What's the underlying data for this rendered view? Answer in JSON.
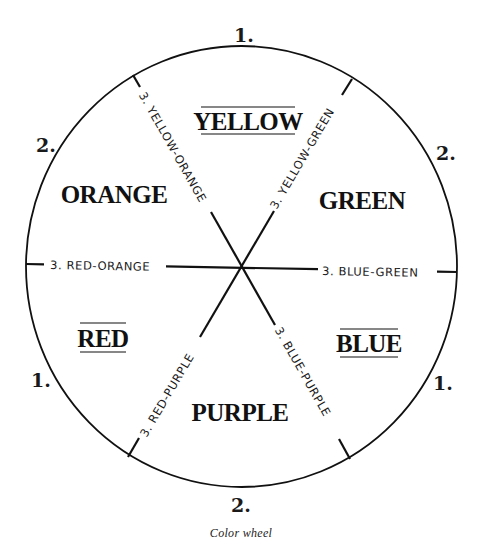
{
  "figure": {
    "caption": "Color wheel",
    "line_color": "#111111",
    "background": "#ffffff"
  },
  "rank_markers": {
    "top": "1.",
    "upper_left": "2.",
    "upper_right": "2.",
    "lower_left": "1.",
    "lower_right": "1.",
    "bottom": "2."
  },
  "segments": {
    "yellow": {
      "label": "YELLOW",
      "type": "primary",
      "underlined": true
    },
    "green": {
      "label": "GREEN",
      "type": "secondary",
      "underlined": false
    },
    "blue": {
      "label": "BLUE",
      "type": "primary",
      "underlined": true
    },
    "purple": {
      "label": "PURPLE",
      "type": "secondary",
      "underlined": false
    },
    "red": {
      "label": "RED",
      "type": "primary",
      "underlined": true
    },
    "orange": {
      "label": "ORANGE",
      "type": "secondary",
      "underlined": false
    }
  },
  "spokes": {
    "yellow_orange": "3. YELLOW-ORANGE",
    "yellow_green": "3. YELLOW-GREEN",
    "red_orange": "3. RED-ORANGE",
    "blue_green": "3. BLUE-GREEN",
    "red_purple": "3. RED-PURPLE",
    "blue_purple": "3. BLUE-PURPLE"
  },
  "legend": {
    "1": "primary colors",
    "2": "secondary colors",
    "3": "tertiary colors"
  }
}
